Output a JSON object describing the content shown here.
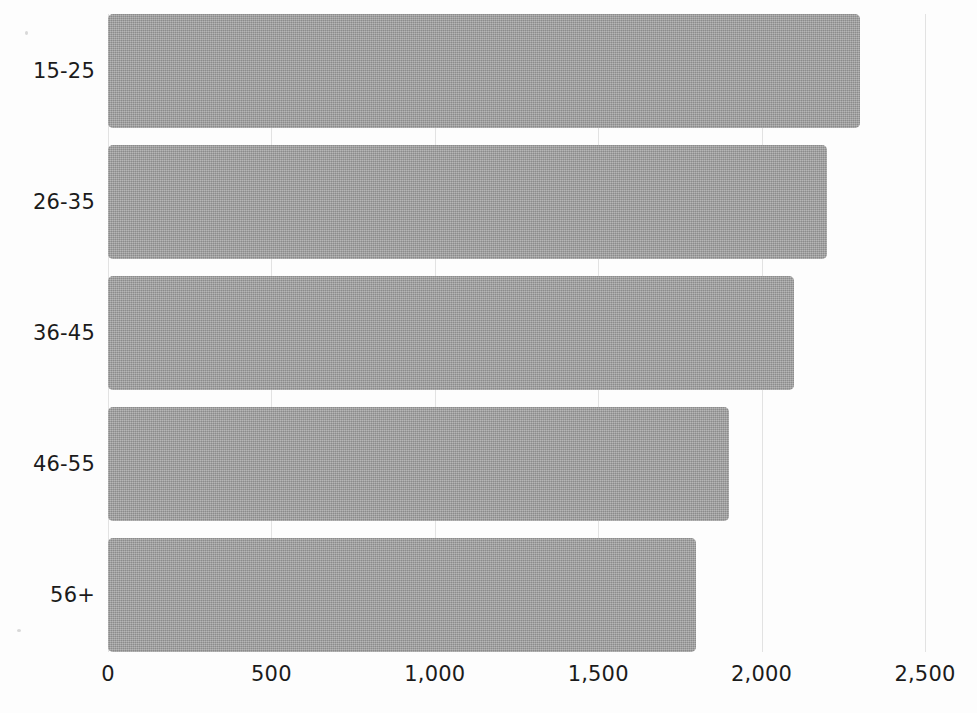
{
  "chart_data": {
    "type": "bar",
    "orientation": "horizontal",
    "title": "",
    "subtitle": "",
    "xlabel": "",
    "ylabel": "",
    "categories": [
      "15-25",
      "26-35",
      "36-45",
      "46-55",
      "56+"
    ],
    "values": [
      2300,
      2200,
      2100,
      1900,
      1800
    ],
    "series": [
      {
        "name": "",
        "values": [
          2300,
          2200,
          2100,
          1900,
          1800
        ]
      }
    ],
    "xlim": [
      0,
      2500
    ],
    "xticks": [
      0,
      500,
      1000,
      1500,
      2000,
      2500
    ],
    "xticklabels": [
      "0",
      "500",
      "1,000",
      "1,500",
      "2,000",
      "2,500"
    ],
    "grid": true,
    "grid_axis": "x",
    "legend": false,
    "legend_position": "none",
    "annotations": [],
    "colors": {
      "bar_fill": "#9a9a9a",
      "background": "#fdfdfd",
      "gridline": "#e2e2e2",
      "text": "#1b1b1b"
    }
  }
}
